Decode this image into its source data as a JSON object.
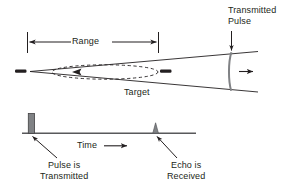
{
  "figure": {
    "background_color": "#ffffff",
    "line_color": "#231f20",
    "pulse_color": "#808285"
  },
  "labels": {
    "range": "Range",
    "target": "Target",
    "transmitted_pulse_line1": "Transmitted",
    "transmitted_pulse_line2": "Pulse",
    "time": "Time",
    "pulse_transmitted_line1": "Pulse is",
    "pulse_transmitted_line2": "Transmitted",
    "echo_received_line1": "Echo is",
    "echo_received_line2": "Received"
  },
  "icons": {
    "range_dimension": "double-headed-arrow-icon",
    "echo_return": "left-arrow-icon",
    "pulse_travel": "right-arrow-icon",
    "time_direction": "right-arrow-icon",
    "transmitted_pulse_pointer": "down-arrow-icon",
    "pulse_callout": "up-left-leader-arrow-icon",
    "echo_callout": "up-left-leader-arrow-icon",
    "antenna_marker": "antenna-dash-icon",
    "target_marker": "target-dash-icon",
    "target_outline": "dashed-ellipse-icon",
    "wavefront": "curved-arc-icon"
  }
}
